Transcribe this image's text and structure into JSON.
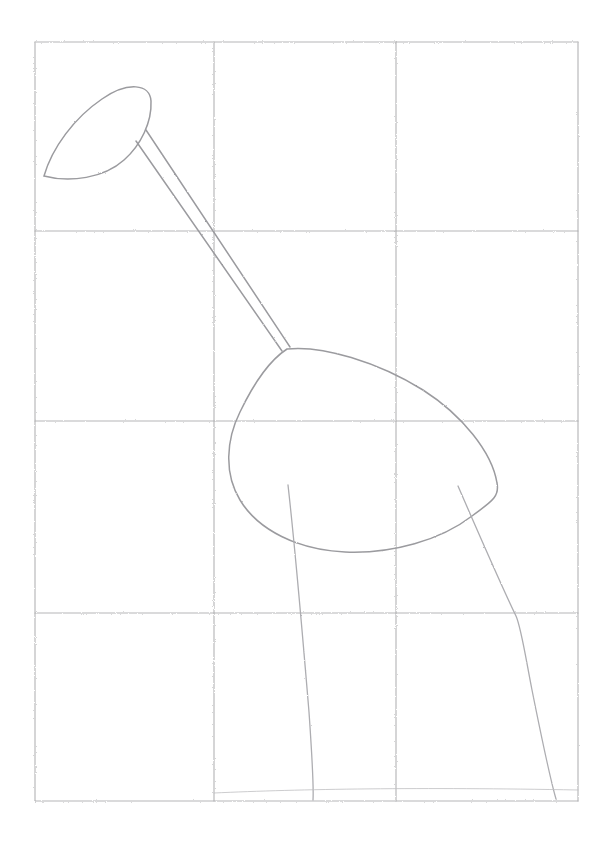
{
  "artwork": {
    "title": "Pencil sketch of a bird on a proportion grid",
    "medium": "graphite pencil line drawing",
    "background_color": "#ffffff",
    "stroke_color": "#9b9b9f",
    "grid_color": "#a9a9ac",
    "canvas": {
      "width": 612,
      "height": 858
    }
  },
  "grid": {
    "columns": 3,
    "rows": 4,
    "vertical_lines_x": [
      35,
      214,
      396,
      578
    ],
    "horizontal_lines_y": [
      42,
      231,
      421,
      613,
      801
    ],
    "cell_width": 181,
    "cell_height": 190,
    "style": "hand-drawn light pencil guide grid"
  },
  "subject": {
    "name": "bird",
    "parts": [
      {
        "label": "head",
        "description": "teardrop/beak shape in upper-left cell, point toward lower-left"
      },
      {
        "label": "neck",
        "description": "two long parallel strokes from head down-right to body"
      },
      {
        "label": "body",
        "description": "rounded shield shape spanning center and right cells"
      },
      {
        "label": "front-leg",
        "description": "long curved line descending to baseline"
      },
      {
        "label": "rear-leg",
        "description": "curved line with knee bend descending to baseline"
      },
      {
        "label": "ground-line",
        "description": "faint horizontal line at the base"
      }
    ]
  },
  "shapes": {
    "head_path": "M 44 176 C 52 148, 74 118, 102 99 C 128 81, 150 84, 151 101 C 152 122, 141 145, 124 160 C 104 178, 70 183, 44 176 Z",
    "neck_upper": "M 146 130 L 290 347",
    "neck_lower": "M 136 141 L 282 351",
    "body_path": "M 287 349 C 322 345, 378 362, 423 390 C 462 415, 492 452, 497 483 C 500 498, 489 503, 472 516 C 441 540, 392 554, 345 552 C 298 550, 258 530, 240 500 C 224 474, 226 440, 240 412 C 252 387, 267 362, 287 349 Z",
    "front_leg": "M 288 485 C 296 556, 303 640, 309 712 C 312 756, 314 784, 313 800",
    "rear_leg": "M 458 486 C 478 532, 500 583, 516 616 C 521 627, 525 654, 532 690 C 541 735, 550 778, 556 799",
    "ground_line": "M 214 793 C 300 789, 420 787, 578 790"
  }
}
